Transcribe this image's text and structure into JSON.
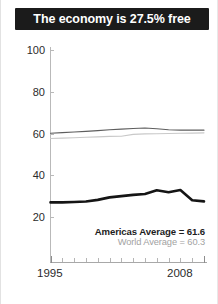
{
  "title": {
    "text": "The economy is 27.5% free"
  },
  "legend": [
    {
      "key": "americas",
      "label": "Americas Average = 61.6",
      "color": "#5e5e5e"
    },
    {
      "key": "world",
      "label": "World Average = 60.3",
      "color": "#c4c4c4"
    }
  ],
  "axis": {
    "y_ticks": [
      "100",
      "80",
      "60",
      "40",
      "20"
    ],
    "x_labels": {
      "start": "1995",
      "end": "2008"
    }
  },
  "colors": {
    "banner_bg": "#1b1b1b",
    "banner_text": "#ffffff",
    "country_line": "#151515",
    "americas_line": "#5e5e5e",
    "world_line": "#c9c9c9",
    "axis": "#b0b0b0",
    "tick_text": "#2b2b2b"
  },
  "chart_data": {
    "type": "line",
    "title": "The economy is 27.5% free",
    "xlabel": "",
    "ylabel": "",
    "ylim": [
      0,
      100
    ],
    "xlim": [
      1995,
      2008
    ],
    "grid": false,
    "legend_position": "bottom-right",
    "y_ticks": [
      20,
      40,
      60,
      80,
      100
    ],
    "x": [
      1995,
      1996,
      1997,
      1998,
      1999,
      2000,
      2001,
      2002,
      2003,
      2004,
      2005,
      2006,
      2007,
      2008
    ],
    "series": [
      {
        "name": "Country",
        "color": "#151515",
        "width": "bold",
        "values": [
          27.0,
          27.0,
          27.2,
          27.4,
          28.2,
          29.4,
          30.0,
          30.6,
          31.0,
          32.8,
          31.9,
          32.9,
          28.0,
          27.5
        ]
      },
      {
        "name": "Americas Average = 61.6",
        "color": "#5e5e5e",
        "width": "thin",
        "values": [
          60.1,
          60.4,
          60.7,
          61.0,
          61.4,
          61.8,
          62.1,
          62.4,
          62.6,
          62.3,
          61.8,
          61.6,
          61.6,
          61.6
        ]
      },
      {
        "name": "World Average = 60.3",
        "color": "#c9c9c9",
        "width": "thin",
        "values": [
          57.6,
          57.8,
          58.0,
          58.2,
          58.4,
          58.6,
          58.7,
          59.6,
          59.8,
          59.9,
          60.0,
          60.1,
          60.2,
          60.3
        ]
      }
    ],
    "annotations": [
      {
        "text": "Americas Average = 61.6"
      },
      {
        "text": "World Average = 60.3"
      }
    ]
  }
}
